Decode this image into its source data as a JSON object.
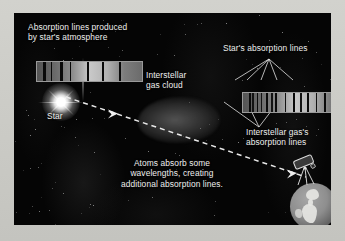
{
  "figure": {
    "domain": "diagram",
    "background_color": "#050505",
    "mat_color": "#c8c8c3",
    "text_color": "#efefef"
  },
  "labels": {
    "top_caption": "Absorption lines produced\nby star's atmosphere",
    "star": "Star",
    "gas_cloud": "Interstellar\ngas cloud",
    "star_absorption_lines": "Star's absorption lines",
    "interstellar_absorption_lines": "Interstellar gas's\nabsorption lines",
    "bottom_caption": "Atoms absorb some\nwavelengths, creating\nadditional absorption lines."
  },
  "spectra": {
    "left": {
      "name": "stellar-spectrum",
      "caption_ref": "top_caption",
      "band_colors": [
        "#555555",
        "#6a6a6a",
        "#8a8a8a",
        "#c9c9c9",
        "#b2b2b2",
        "#7d7d7d",
        "#6b6b6b"
      ],
      "absorption_lines_pct": [
        6,
        13,
        22,
        31,
        48,
        62,
        78
      ],
      "line_widths_pct": [
        2.2,
        1.6,
        2.4,
        1.8,
        2.0,
        1.6,
        2.2
      ]
    },
    "right": {
      "name": "observed-spectrum",
      "caption_ref": "interstellar_absorption_lines",
      "band_colors": [
        "#555555",
        "#6a6a6a",
        "#8a8a8a",
        "#c9c9c9",
        "#b2b2b2",
        "#7d7d7d",
        "#6b6b6b"
      ],
      "stellar_lines_pct": [
        6,
        13,
        22,
        31,
        48,
        62,
        78
      ],
      "interstellar_lines_pct": [
        9,
        17,
        27,
        40,
        55,
        70,
        86
      ],
      "line_widths_pct": [
        1.8,
        1.4,
        2.0,
        1.6,
        1.8,
        1.4,
        1.8
      ]
    }
  },
  "light_path": {
    "name": "starlight-ray",
    "style": "dashed",
    "color": "#e8e8e8",
    "from": "star",
    "through": "gas_cloud",
    "to": "telescope",
    "arrowheads": 2
  },
  "objects": {
    "star": {
      "name": "star",
      "color": "#ffffff"
    },
    "gas_cloud": {
      "name": "interstellar-gas-cloud",
      "color": "#808080"
    },
    "earth": {
      "name": "earth-globe",
      "color": "#8e8e8e"
    },
    "telescope": {
      "name": "telescope",
      "color": "#d8d8d8"
    }
  },
  "leader_lines": {
    "star_lines_count": 5,
    "interstellar_lines_count": 3
  }
}
